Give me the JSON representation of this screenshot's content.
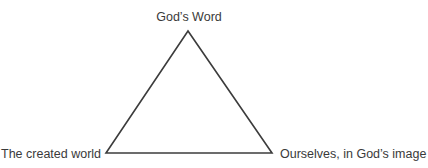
{
  "diagram": {
    "type": "triangle",
    "stroke_color": "#3c3c3c",
    "vertices": {
      "top": {
        "label": "God’s Word"
      },
      "bottom_left": {
        "label": "The created world"
      },
      "bottom_right": {
        "label": "Ourselves, in God’s image"
      }
    }
  }
}
